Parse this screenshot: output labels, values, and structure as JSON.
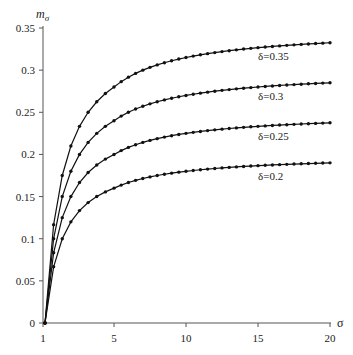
{
  "chart_data": {
    "type": "line",
    "title": "",
    "xlabel": "σ",
    "ylabel": "mσ",
    "ylabel_main": "m",
    "ylabel_sub": "σ",
    "xlim": [
      1,
      20
    ],
    "ylim": [
      0,
      0.35
    ],
    "x_ticks": [
      "1",
      "5",
      "10",
      "15",
      "20"
    ],
    "x_tick_values": [
      1,
      5,
      10,
      15,
      20
    ],
    "y_ticks": [
      "0",
      "0.05",
      "0.1",
      "0.15",
      "0.2",
      "0.25",
      "0.3",
      "0.35"
    ],
    "y_tick_values": [
      0,
      0.05,
      0.1,
      0.15,
      0.2,
      0.25,
      0.3,
      0.35
    ],
    "grid": false,
    "legend": "inline labels below each curve end",
    "x": [
      1,
      1.5,
      2,
      2.5,
      3,
      3.5,
      4,
      4.5,
      5,
      5.5,
      6,
      6.5,
      7,
      7.5,
      8,
      8.5,
      9,
      9.5,
      10,
      10.5,
      11,
      11.5,
      12,
      12.5,
      13,
      13.5,
      14,
      14.5,
      15,
      15.5,
      16,
      16.5,
      17,
      17.5,
      18,
      18.5,
      19,
      19.5,
      20
    ],
    "series": [
      {
        "name": "δ=0.35",
        "delta": 0.35,
        "label": "δ=0.35",
        "end_value": 0.333
      },
      {
        "name": "δ=0.3",
        "delta": 0.3,
        "label": "δ=0.3",
        "end_value": 0.285
      },
      {
        "name": "δ=0.25",
        "delta": 0.25,
        "label": "δ=0.25",
        "end_value": 0.234
      },
      {
        "name": "δ=0.2",
        "delta": 0.2,
        "label": "δ=0.2",
        "end_value": 0.184
      }
    ],
    "model": "m_sigma ≈ delta * (1 - 1/sigma)",
    "line_color": "#111111",
    "marker": "filled-circle"
  }
}
